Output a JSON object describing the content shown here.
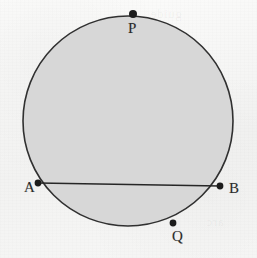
{
  "figure": {
    "kind": "circle-with-chord-diagram",
    "caption": "",
    "background_color": "#f6f6f5",
    "ink_color": "#2b2b2b",
    "circle": {
      "name": "circle",
      "fill_color": "#d7d7d7",
      "stroke_color": "#303030",
      "stroke_width": 1.6,
      "center_x": 128,
      "center_y": 121,
      "radius": 105
    },
    "chord": {
      "name": "chord-AB",
      "label": "AB",
      "stroke_color": "#262626",
      "stroke_width": 1.6,
      "x1": 38,
      "y1": 183,
      "x2": 220,
      "y2": 186
    },
    "points": [
      {
        "id": "P",
        "label": "P",
        "x": 133,
        "y": 14,
        "label_x": 128,
        "label_y": 21,
        "marker_radius": 4.0,
        "color": "#1c1c1c"
      },
      {
        "id": "A",
        "label": "A",
        "x": 38,
        "y": 183,
        "label_x": 24,
        "label_y": 180,
        "marker_radius": 3.4,
        "color": "#1c1c1c"
      },
      {
        "id": "B",
        "label": "B",
        "x": 220,
        "y": 186,
        "label_x": 229,
        "label_y": 181,
        "marker_radius": 3.4,
        "color": "#1c1c1c"
      },
      {
        "id": "Q",
        "label": "Q",
        "x": 173,
        "y": 223,
        "label_x": 172,
        "label_y": 229,
        "marker_radius": 3.4,
        "color": "#1c1c1c"
      }
    ],
    "ghost_text": [
      {
        "text": "guide",
        "x": 150,
        "y": 6,
        "size": 13,
        "opacity": 0.06
      },
      {
        "text": "the",
        "x": 104,
        "y": 34,
        "size": 13,
        "opacity": 0.05
      },
      {
        "text": "same",
        "x": 120,
        "y": 52,
        "size": 13,
        "opacity": 0.05
      },
      {
        "text": "line",
        "x": 60,
        "y": 112,
        "size": 13,
        "opacity": 0.06
      },
      {
        "text": "notes",
        "x": 96,
        "y": 126,
        "size": 13,
        "opacity": 0.05
      },
      {
        "text": "the",
        "x": 72,
        "y": 160,
        "size": 13,
        "opacity": 0.05
      },
      {
        "text": "circle",
        "x": 136,
        "y": 168,
        "size": 13,
        "opacity": 0.05
      },
      {
        "text": "below",
        "x": 88,
        "y": 206,
        "size": 13,
        "opacity": 0.05
      },
      {
        "text": "arc",
        "x": 206,
        "y": 214,
        "size": 13,
        "opacity": 0.05
      }
    ]
  }
}
